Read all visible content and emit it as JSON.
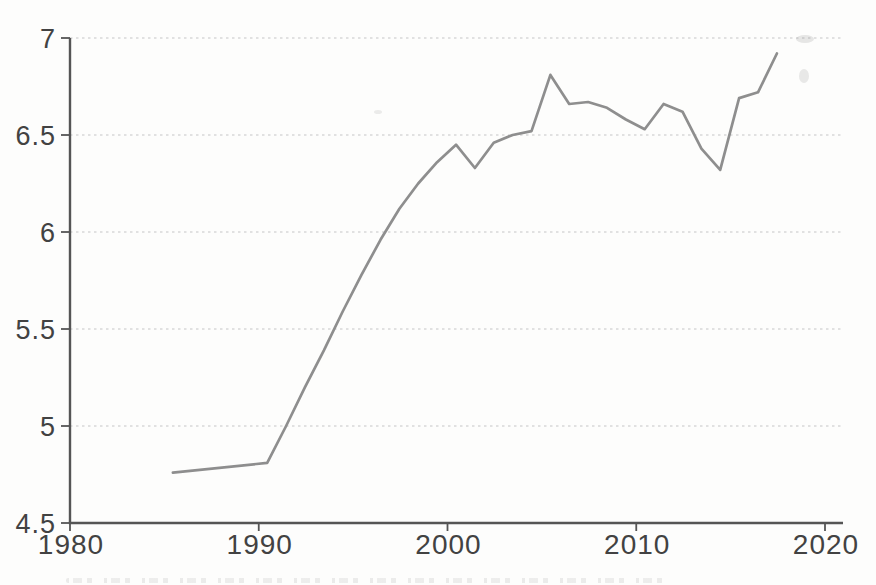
{
  "page": {
    "kind": "scanned-book-line-chart",
    "background_color": "#fdfdfc"
  },
  "chart_data": {
    "type": "line",
    "title": "",
    "subtitle": "",
    "xlabel": "",
    "ylabel": "",
    "legend": "none",
    "grid": "horizontal dotted lines at each y tick",
    "xlim": [
      1980,
      2021
    ],
    "ylim": [
      4.5,
      7
    ],
    "x_ticks": [
      1980,
      1990,
      2000,
      2010,
      2020
    ],
    "x_tick_labels": [
      "1980",
      "1990",
      "2000",
      "2010",
      "2020"
    ],
    "y_ticks": [
      4.5,
      5,
      5.5,
      6,
      6.5,
      7
    ],
    "y_tick_labels": [
      "4.5",
      "5",
      "5.5",
      "6",
      "6.5",
      "7"
    ],
    "series": [
      {
        "name": "series-1",
        "color": "#8e8e8e",
        "x": [
          1985,
          1990,
          1991,
          1992,
          1993,
          1994,
          1995,
          1996,
          1997,
          1998,
          1999,
          2000,
          2001,
          2002,
          2003,
          2004,
          2005,
          2006,
          2007,
          2008,
          2009,
          2010,
          2011,
          2012,
          2013,
          2014,
          2015,
          2016,
          2017
        ],
        "values": [
          4.76,
          4.81,
          5.0,
          5.2,
          5.39,
          5.59,
          5.78,
          5.96,
          6.12,
          6.25,
          6.36,
          6.45,
          6.33,
          6.46,
          6.5,
          6.52,
          6.81,
          6.66,
          6.67,
          6.64,
          6.58,
          6.53,
          6.66,
          6.62,
          6.43,
          6.32,
          6.69,
          6.72,
          6.92
        ]
      }
    ]
  },
  "style": {
    "axis_color": "#555555",
    "tick_label_color": "#424242",
    "gridline_color": "#c6c6c6",
    "line_color": "#8e8e8e"
  },
  "artifacts": {
    "description": "scan artifacts: faint smudges near top-right and an illegible cut-off caption line at the bottom edge",
    "caption_legible": false
  }
}
